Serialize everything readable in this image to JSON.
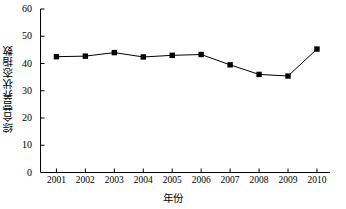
{
  "chart_data": {
    "type": "line",
    "title": "",
    "xlabel": "年份",
    "ylabel": "综合营养状态指数",
    "categories": [
      "2001",
      "2002",
      "2003",
      "2004",
      "2005",
      "2006",
      "2007",
      "2008",
      "2009",
      "2010"
    ],
    "values": [
      42.5,
      42.7,
      44.0,
      42.4,
      43.0,
      43.3,
      39.5,
      36.0,
      35.4,
      45.3
    ],
    "series": [
      {
        "name": "综合营养状态指数",
        "values": [
          42.5,
          42.7,
          44.0,
          42.4,
          43.0,
          43.3,
          39.5,
          36.0,
          35.4,
          45.3
        ]
      }
    ],
    "ylim": [
      0,
      60
    ],
    "ytick_labels": [
      "0",
      "10",
      "20",
      "30",
      "40",
      "50",
      "60"
    ],
    "ytick_values": [
      0,
      10,
      20,
      30,
      40,
      50,
      60
    ],
    "xtick_labels": [
      "2001",
      "2002",
      "2003",
      "2004",
      "2005",
      "2006",
      "2007",
      "2008",
      "2009",
      "2010"
    ],
    "grid": false,
    "legend": "none",
    "marker": "square",
    "line_color": "#000000",
    "marker_color": "#000000",
    "axis_color": "#000000"
  },
  "axes": {
    "y_title": "综合营养状态指数",
    "x_title": "年份"
  }
}
